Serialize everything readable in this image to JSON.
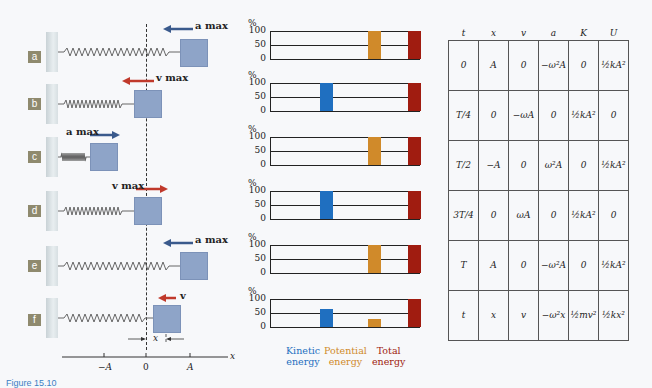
{
  "figure": {
    "caption": "Figure 15.10",
    "panel_labels": [
      "a",
      "b",
      "c",
      "d",
      "e",
      "f"
    ],
    "vectors": {
      "a": "a max",
      "b": "v max",
      "c": "a max",
      "d": "v max",
      "e": "a max",
      "f": "v"
    },
    "x_axis": {
      "ticks": [
        "−A",
        "0",
        "A"
      ],
      "label": "x",
      "displacement_label": "x"
    }
  },
  "chart_data": {
    "type": "bar",
    "categories": [
      "Kinetic energy",
      "Potential energy",
      "Total energy"
    ],
    "ylabel": "%",
    "ylim": [
      0,
      100
    ],
    "yticks": [
      0,
      50,
      100
    ],
    "panels": [
      {
        "panel": "a",
        "values": [
          0,
          100,
          100
        ]
      },
      {
        "panel": "b",
        "values": [
          100,
          0,
          100
        ]
      },
      {
        "panel": "c",
        "values": [
          0,
          100,
          100
        ]
      },
      {
        "panel": "d",
        "values": [
          100,
          0,
          100
        ]
      },
      {
        "panel": "e",
        "values": [
          0,
          100,
          100
        ]
      },
      {
        "panel": "f",
        "values": [
          65,
          30,
          100
        ]
      }
    ],
    "colors": {
      "kinetic": "#1f6fc0",
      "potential": "#d08a2a",
      "total": "#a01c10"
    }
  },
  "legend": {
    "kinetic": [
      "Kinetic",
      "energy"
    ],
    "potential": [
      "Potential",
      "energy"
    ],
    "total": [
      "Total",
      "energy"
    ]
  },
  "table": {
    "headers": [
      "t",
      "x",
      "v",
      "a",
      "K",
      "U"
    ],
    "rows": [
      [
        "0",
        "A",
        "0",
        "−ω²A",
        "0",
        "½kA²"
      ],
      [
        "T/4",
        "0",
        "−ωA",
        "0",
        "½kA²",
        "0"
      ],
      [
        "T/2",
        "−A",
        "0",
        "ω²A",
        "0",
        "½kA²"
      ],
      [
        "3T/4",
        "0",
        "ωA",
        "0",
        "½kA²",
        "0"
      ],
      [
        "T",
        "A",
        "0",
        "−ω²A",
        "0",
        "½kA²"
      ],
      [
        "t",
        "x",
        "v",
        "−ω²x",
        "½mv²",
        "½kx²"
      ]
    ]
  }
}
